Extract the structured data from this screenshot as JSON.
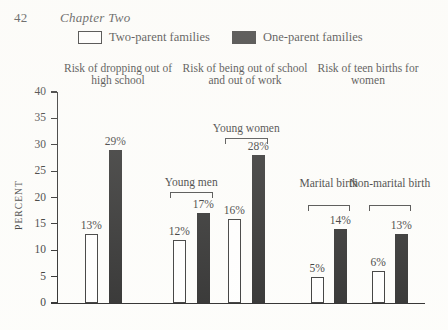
{
  "page": {
    "folio": "42",
    "chapter": "Chapter Two"
  },
  "legend": {
    "items": [
      {
        "label": "Two-parent families",
        "swatch": "white"
      },
      {
        "label": "One-parent families",
        "swatch": "black"
      }
    ]
  },
  "column_headings": [
    "Risk of dropping\nout of\nhigh school",
    "Risk of being\nout of school and\nout of work",
    "Risk of\nteen births\nfor women"
  ],
  "chart_data": {
    "type": "bar",
    "title": "",
    "xlabel": "",
    "ylabel": "PERCENT",
    "ylim": [
      0,
      40
    ],
    "yticks": [
      0,
      5,
      10,
      15,
      20,
      25,
      30,
      35,
      40
    ],
    "ytick_labels": [
      "0",
      "5",
      "10",
      "15",
      "20",
      "25",
      "30",
      "35",
      "40"
    ],
    "grid": false,
    "legend_position": "top",
    "categories": [
      "Risk of dropping out of high school",
      "Young men",
      "Young women",
      "Marital birth",
      "Non-marital birth"
    ],
    "series": [
      {
        "name": "Two-parent families",
        "color": "#ffffff",
        "values": [
          13,
          12,
          16,
          5,
          6
        ]
      },
      {
        "name": "One-parent families",
        "color": "#151515",
        "values": [
          29,
          17,
          28,
          14,
          13
        ]
      }
    ],
    "data_labels": {
      "two_parent": [
        "13%",
        "12%",
        "16%",
        "5%",
        "6%"
      ],
      "one_parent": [
        "29%",
        "17%",
        "28%",
        "14%",
        "13%"
      ]
    },
    "group_brackets": [
      {
        "label": "Young men",
        "group": 1
      },
      {
        "label": "Young women",
        "group": 2
      },
      {
        "label": "Marital\nbirth",
        "group": 3
      },
      {
        "label": "Non-marital\nbirth",
        "group": 4
      }
    ]
  }
}
